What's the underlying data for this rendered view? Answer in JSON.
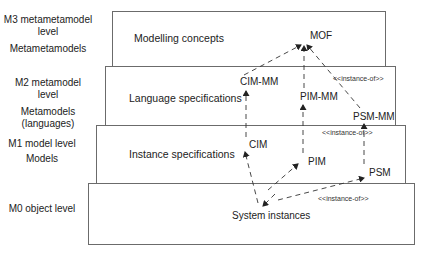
{
  "levels": [
    {
      "id": "m3",
      "name": "M3 metametamodel level",
      "models": "Metametamodels",
      "box_title": "Modelling concepts"
    },
    {
      "id": "m2",
      "name": "M2 metamodel level",
      "models": "Metamodels (languages)",
      "box_title": "Language specifications"
    },
    {
      "id": "m1",
      "name": "M1 model level",
      "models": "Models",
      "box_title": "Instance specifications"
    },
    {
      "id": "m0",
      "name": "M0 object level",
      "models": "",
      "box_title": ""
    }
  ],
  "labels": {
    "m3_line1": "M3 metametamodel",
    "m3_line2": "level",
    "m3_models": "Metametamodels",
    "m2_line1": "M2 metamodel",
    "m2_line2": "level",
    "m2_models_1": "Metamodels",
    "m2_models_2": "(languages)",
    "m1_line1": "M1 model level",
    "m1_models": "Models",
    "m0_line1": "M0 object level"
  },
  "nodes": {
    "mof": "MOF",
    "cim_mm": "CIM-MM",
    "pim_mm": "PIM-MM",
    "psm_mm": "PSM-MM",
    "cim": "CIM",
    "pim": "PIM",
    "psm": "PSM",
    "system_instances": "System instances"
  },
  "stereotypes": {
    "m2": "<<instance-of>>",
    "m1": "<<instance-of>>",
    "m0": "<<instance-of>>"
  },
  "colors": {
    "border": "#6b6b6b",
    "arrow": "#333333",
    "text": "#222222"
  }
}
